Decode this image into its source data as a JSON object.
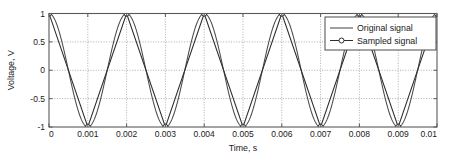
{
  "chart_data": {
    "type": "line",
    "title": "",
    "xlabel": "Time, s",
    "ylabel": "Voltage, V",
    "xlim": [
      0,
      0.01
    ],
    "ylim": [
      -1,
      1
    ],
    "xticks": [
      0,
      0.001,
      0.002,
      0.003,
      0.004,
      0.005,
      0.006,
      0.007,
      0.008,
      0.009,
      0.01
    ],
    "xticklabels": [
      "0",
      "0.001",
      "0.002",
      "0.003",
      "0.004",
      "0.005",
      "0.006",
      "0.007",
      "0.008",
      "0.009",
      "0.01"
    ],
    "yticks": [
      1,
      0.5,
      0,
      -0.5,
      -1
    ],
    "yticklabels": [
      "1",
      "0.5",
      "0",
      "-0.5",
      "-1"
    ],
    "grid": "dotted-both-axes",
    "legend_position": "upper-right",
    "series": [
      {
        "name": "Original signal",
        "marker": "none",
        "linestyle": "solid",
        "color": "#3a3a3a",
        "description": "Continuous sinusoid, amplitude 1 V, frequency 500 Hz, cosine phase (starts at +1), 5 full cycles across 0.01 s",
        "frequency_hz": 500,
        "amplitude_v": 1.0,
        "phase": "cosine",
        "samples_x": [
          0,
          0.00025,
          0.0005,
          0.00075,
          0.001,
          0.00125,
          0.0015,
          0.00175,
          0.002,
          0.00225,
          0.0025,
          0.00275,
          0.003,
          0.00325,
          0.0035,
          0.00375,
          0.004,
          0.00425,
          0.0045,
          0.00475,
          0.005,
          0.00525,
          0.0055,
          0.00575,
          0.006,
          0.00625,
          0.0065,
          0.00675,
          0.007,
          0.00725,
          0.0075,
          0.00775,
          0.008,
          0.00825,
          0.0085,
          0.00875,
          0.009,
          0.00925,
          0.0095,
          0.00975,
          0.01
        ],
        "samples_y": [
          1,
          0,
          -1,
          0,
          1,
          0,
          -1,
          0,
          1,
          0,
          -1,
          0,
          1,
          0,
          -1,
          0,
          1,
          0,
          -1,
          0,
          1,
          0,
          -1,
          0,
          1,
          0,
          -1,
          0,
          1,
          0,
          -1,
          0,
          1,
          0,
          -1,
          0,
          1,
          0,
          -1,
          0,
          1
        ]
      },
      {
        "name": "Sampled signal",
        "marker": "circle",
        "linestyle": "solid",
        "color": "#3a3a3a",
        "description": "Sampled and linearly reconstructed waveform, sample interval 0.001 s, markers at every sample at alternating +1 V and -1 V",
        "sample_interval_s": 0.001,
        "points_x": [
          0,
          0.001,
          0.002,
          0.003,
          0.004,
          0.005,
          0.006,
          0.007,
          0.008,
          0.009,
          0.01
        ],
        "points_y": [
          1,
          -1,
          1,
          -1,
          1,
          -1,
          1,
          -1,
          1,
          -1,
          1
        ]
      }
    ]
  },
  "legend": {
    "entries": [
      {
        "label": "Original signal",
        "marker": "none"
      },
      {
        "label": "Sampled signal",
        "marker": "circle"
      }
    ]
  },
  "axes": {
    "x_title": "Time, s",
    "y_title": "Voltage, V"
  }
}
